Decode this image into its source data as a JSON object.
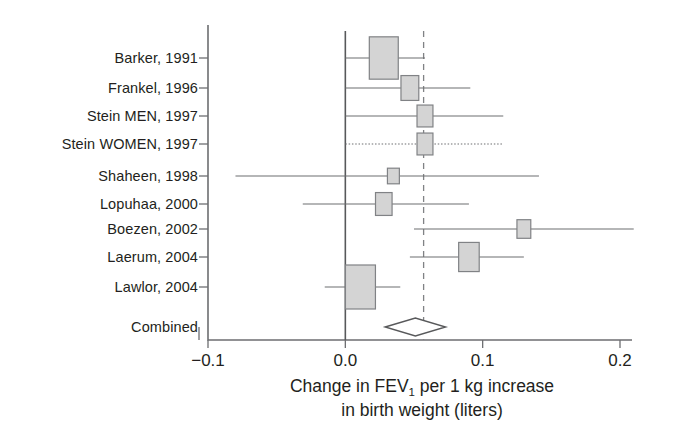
{
  "figure": {
    "title": "",
    "axis_title_line1_pre": "Change in FEV",
    "axis_title_line1_sub": "1",
    "axis_title_line1_post": " per 1 kg increase",
    "axis_title_line2": "in birth weight (liters)",
    "combined_label": "Combined",
    "colors": {
      "background": "#ffffff",
      "ink": "#231f20",
      "axis": "#6d6e71",
      "box_fill": "#d4d4d4",
      "box_stroke": "#808285",
      "zero_line": "#58595b",
      "pooled_line": "#808285",
      "diamond_fill": "#ffffff",
      "diamond_stroke": "#58595b"
    }
  },
  "chart_data": {
    "type": "forest",
    "title": "",
    "xlabel": "Change in FEV1 per 1 kg increase in birth weight (liters)",
    "ylabel": "",
    "xlim": [
      -0.12,
      0.215
    ],
    "xticks": [
      -0.1,
      0.0,
      0.1,
      0.2
    ],
    "xticklabels": [
      "−0.1",
      "0.0",
      "0.1",
      "0.2"
    ],
    "grid": false,
    "legend": "none",
    "reference_line_x": 0.0,
    "pooled_line_x": 0.057,
    "categories": [
      "Barker, 1991",
      "Frankel, 1996",
      "Stein MEN, 1997",
      "Stein WOMEN, 1997",
      "Shaheen, 1998",
      "Lopuhaa, 2000",
      "Boezen, 2002",
      "Laerum, 2004",
      "Lawlor, 2004"
    ],
    "studies": [
      {
        "label": "Barker, 1991",
        "estimate": 0.028,
        "ci_low": 0.0,
        "ci_high": 0.058,
        "box_weight": 0.95,
        "ci_style": "solid"
      },
      {
        "label": "Frankel, 1996",
        "estimate": 0.047,
        "ci_low": 0.0,
        "ci_high": 0.091,
        "box_weight": 0.42,
        "ci_style": "solid"
      },
      {
        "label": "Stein MEN, 1997",
        "estimate": 0.058,
        "ci_low": 0.0,
        "ci_high": 0.115,
        "box_weight": 0.33,
        "ci_style": "solid"
      },
      {
        "label": "Stein WOMEN, 1997",
        "estimate": 0.058,
        "ci_low": 0.0,
        "ci_high": 0.115,
        "box_weight": 0.33,
        "ci_style": "dotted"
      },
      {
        "label": "Shaheen, 1998",
        "estimate": 0.035,
        "ci_low": -0.08,
        "ci_high": 0.141,
        "box_weight": 0.14,
        "ci_style": "solid"
      },
      {
        "label": "Lopuhaa, 2000",
        "estimate": 0.028,
        "ci_low": -0.031,
        "ci_high": 0.09,
        "box_weight": 0.36,
        "ci_style": "solid"
      },
      {
        "label": "Boezen, 2002",
        "estimate": 0.13,
        "ci_low": 0.05,
        "ci_high": 0.21,
        "box_weight": 0.23,
        "ci_style": "solid"
      },
      {
        "label": "Laerum, 2004",
        "estimate": 0.09,
        "ci_low": 0.047,
        "ci_high": 0.13,
        "box_weight": 0.55,
        "ci_style": "solid"
      },
      {
        "label": "Lawlor, 2004",
        "estimate": 0.011,
        "ci_low": -0.015,
        "ci_high": 0.04,
        "box_weight": 1.0,
        "ci_style": "solid"
      }
    ],
    "combined": {
      "label": "Combined",
      "estimate": 0.051,
      "ci_low": 0.029,
      "ci_high": 0.073
    }
  }
}
